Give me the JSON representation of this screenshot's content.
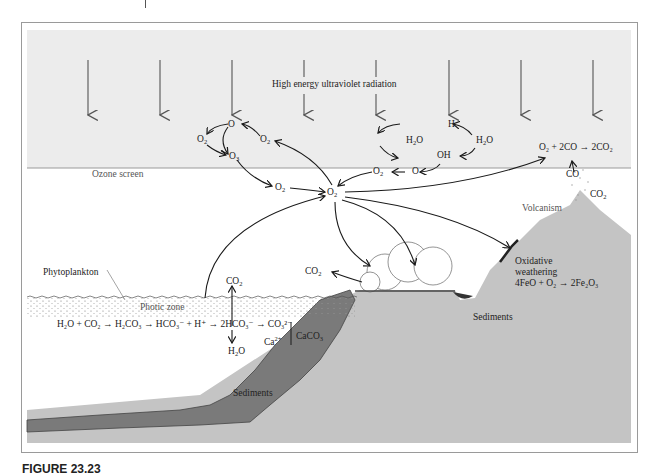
{
  "figure": {
    "caption_label": "FIGURE 23.23",
    "caption_text": ""
  },
  "labels": {
    "uv_radiation": "High energy ultraviolet radiation",
    "ozone_screen": "Ozone screen",
    "phytoplankton": "Phytoplankton",
    "photic_zone": "Photic zone",
    "volcanism": "Volcanism",
    "oxidative_weathering_1": "Oxidative",
    "oxidative_weathering_2": "weathering",
    "sediments_land": "Sediments",
    "sediments_sea": "Sediments"
  },
  "chemistry": {
    "ozone_cycle": {
      "o": "O",
      "o2_left": "O",
      "o2_right": "O",
      "o3": "O"
    },
    "water_cycle": {
      "h": "H",
      "h2o_left": "H",
      "h2o_right": "H",
      "oh": "OH"
    },
    "o2_mid": "O",
    "o2_right_chain": "O",
    "o_right_chain": "O",
    "o2_center": "O",
    "co_volcano": "CO",
    "co2_volcano": "CO",
    "co2_plants": "CO",
    "co2_ocean": "CO",
    "h2o_ocean": "H",
    "ca_ion": "Ca",
    "caco3": "CaCO"
  },
  "reactions": {
    "co_oxidation": "O₂ + 2CO → 2CO₂",
    "iron_oxidation": "4FeO + O₂ → 2Fe₂O₃",
    "carbonate_chain": "H₂O + CO₂ → H₂CO₃ → HCO₃⁻ + H⁺ → 2HCO₃⁻ → CO₃²⁻"
  },
  "colors": {
    "sky": "#ececec",
    "land": "#c4c4c4",
    "sediment_dark": "#7a7a7a",
    "arrow_uv": "#555555",
    "arrow_cycle": "#1a1a1a"
  }
}
